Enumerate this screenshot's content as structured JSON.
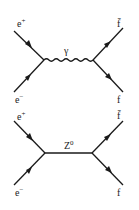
{
  "diagrams": [
    {
      "name": "photon-exchange",
      "mediator": {
        "label": "γ",
        "style": "wavy"
      },
      "incoming": [
        {
          "base": "e",
          "sup": "+"
        },
        {
          "base": "e",
          "sup": "−"
        }
      ],
      "outgoing": [
        {
          "label": "f̄"
        },
        {
          "label": "f"
        }
      ]
    },
    {
      "name": "z-boson-exchange",
      "mediator": {
        "label": "Z",
        "sup": "0",
        "style": "straight"
      },
      "incoming": [
        {
          "base": "e",
          "sup": "+"
        },
        {
          "base": "e",
          "sup": "−"
        }
      ],
      "outgoing": [
        {
          "label": "f̄"
        },
        {
          "label": "f"
        }
      ]
    }
  ]
}
